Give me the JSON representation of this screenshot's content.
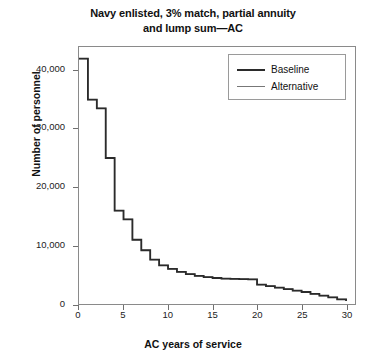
{
  "chart_data": {
    "type": "line",
    "title": "Navy enlisted, 3% match, partial annuity and lump sum—AC",
    "title_line1": "Navy enlisted, 3% match, partial annuity",
    "title_line2": "and lump sum—AC",
    "xlabel": "AC years of service",
    "ylabel": "Number of personnel",
    "xlim": [
      0,
      31
    ],
    "ylim": [
      0,
      44000
    ],
    "xticks": [
      0,
      5,
      10,
      15,
      20,
      25,
      30
    ],
    "xtick_labels": [
      "0",
      "5",
      "10",
      "15",
      "20",
      "25",
      "30"
    ],
    "yticks": [
      0,
      10000,
      20000,
      30000,
      40000
    ],
    "ytick_labels": [
      "0",
      "10,000",
      "20,000",
      "30,000",
      "40,000"
    ],
    "grid": false,
    "legend_position": "top-right",
    "drawstyle": "steps-post",
    "x": [
      0,
      1,
      2,
      3,
      4,
      5,
      6,
      7,
      8,
      9,
      10,
      11,
      12,
      13,
      14,
      15,
      16,
      17,
      18,
      19,
      20,
      21,
      22,
      23,
      24,
      25,
      26,
      27,
      28,
      29,
      30
    ],
    "series": [
      {
        "name": "Baseline",
        "color": "#2b2b2b",
        "width": 1.8,
        "values": [
          42000,
          35000,
          33500,
          25000,
          16000,
          14500,
          11000,
          9200,
          7600,
          6600,
          6000,
          5500,
          5100,
          4800,
          4600,
          4450,
          4350,
          4300,
          4250,
          4200,
          3300,
          3050,
          2800,
          2550,
          2300,
          2050,
          1750,
          1450,
          1150,
          800,
          500
        ]
      },
      {
        "name": "Alternative",
        "color": "#777777",
        "width": 1.2,
        "values": [
          42000,
          35000,
          33500,
          25000,
          16000,
          14500,
          11000,
          9200,
          7600,
          6600,
          6000,
          5500,
          5100,
          4800,
          4600,
          4450,
          4350,
          4300,
          4250,
          4200,
          3300,
          3050,
          2800,
          2550,
          2300,
          2050,
          1750,
          1450,
          1150,
          800,
          500
        ]
      }
    ],
    "legend": [
      {
        "label": "Baseline",
        "color": "#2b2b2b",
        "width": 1.8
      },
      {
        "label": "Alternative",
        "color": "#777777",
        "width": 1.2
      }
    ]
  }
}
